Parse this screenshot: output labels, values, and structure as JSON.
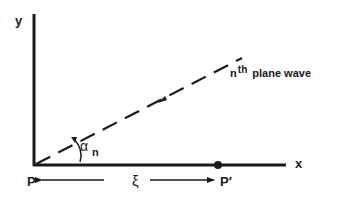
{
  "diagram": {
    "axes": {
      "x_label": "x",
      "y_label": "y"
    },
    "points": {
      "origin_label": "P",
      "shifted_label": "P′"
    },
    "distance_label": "ξ",
    "angle": {
      "symbol": "α",
      "subscript": "n"
    },
    "wave": {
      "superscript_prefix": "n",
      "superscript": "th",
      "label": "plane wave"
    },
    "colors": {
      "ink": "#1a1a1a",
      "background": "#ffffff"
    }
  }
}
